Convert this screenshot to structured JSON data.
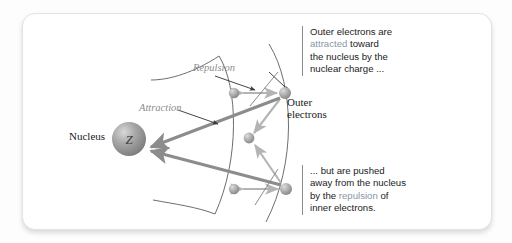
{
  "figure": {
    "type": "diagram",
    "nucleus": {
      "label": "Nucleus",
      "symbol": "Z",
      "center": [
        106,
        125
      ],
      "radius": 17,
      "color": "#9d9d9d"
    },
    "force_labels": {
      "attraction": "Attraction",
      "repulsion": "Repulsion",
      "color": "#8e8e8e"
    },
    "electron_label": {
      "line1": "Outer",
      "line2": "electrons"
    },
    "electrons": [
      {
        "id": "inner-upper",
        "cx": 211,
        "cy": 79,
        "r": 5.2,
        "shell": "inner"
      },
      {
        "id": "inner-middle",
        "cx": 226,
        "cy": 124,
        "r": 5.4,
        "shell": "inner"
      },
      {
        "id": "inner-lower",
        "cx": 211,
        "cy": 175,
        "r": 5.2,
        "shell": "inner"
      },
      {
        "id": "outer-upper",
        "cx": 262,
        "cy": 79,
        "r": 6.0,
        "shell": "outer"
      },
      {
        "id": "outer-lower",
        "cx": 263,
        "cy": 175,
        "r": 6.0,
        "shell": "outer"
      }
    ],
    "shells": [
      {
        "id": "inner-shell-arc",
        "label": "inner electron shell"
      },
      {
        "id": "outer-shell-arc",
        "label": "outer electron shell"
      }
    ],
    "arrows": {
      "attraction_color": "#8c8c8c",
      "repulsion_color": "#b4b4b4",
      "attraction_count": 2,
      "repulsion_count": 4
    }
  },
  "callouts": {
    "top": {
      "lines": [
        "Outer electrons are",
        "attracted toward",
        "the nucleus by the",
        "nuclear charge ..."
      ],
      "line1": "Outer electrons are",
      "line2_highlight": "attracted",
      "line2_rest": " toward",
      "line3": "the nucleus by the",
      "line4": "nuclear charge ...",
      "highlight_color": "#8997a6"
    },
    "bottom": {
      "lines": [
        "... but are pushed",
        "away from the nucleus",
        "by the repulsion of",
        "inner electrons."
      ],
      "line1": "... but are pushed",
      "line2": "away from the nucleus",
      "line3_pre": "by the ",
      "line3_highlight": "repulsion",
      "line3_post": " of",
      "line4": "inner electrons.",
      "highlight_color": "#8997a6"
    }
  },
  "theme": {
    "card_background": "#ffffff",
    "page_background": "#fdfdfd",
    "border_color": "#e3e3e3",
    "text_color": "#1b1b1b"
  }
}
